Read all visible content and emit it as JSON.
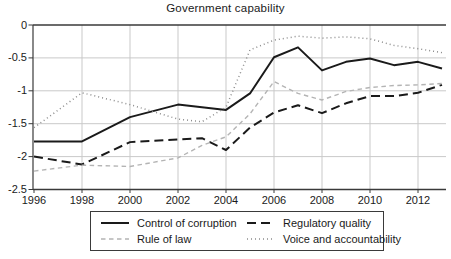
{
  "title": "Government capability",
  "colors": {
    "axis": "#3a3a3a",
    "grid": "#c9c9c9",
    "text": "#1a1a1a",
    "series_black": "#1a1a1a",
    "series_gray_light": "#b4b4b4",
    "series_gray_mid": "#8c8c8c"
  },
  "chart_data": {
    "type": "line",
    "title": "Government capability",
    "xlabel": "",
    "ylabel": "",
    "xlim": [
      1996,
      2013.2
    ],
    "ylim": [
      -2.5,
      0
    ],
    "grid": true,
    "legend_position": "bottom",
    "x": [
      1996,
      1998,
      2000,
      2002,
      2003,
      2004,
      2005,
      2006,
      2007,
      2008,
      2009,
      2010,
      2011,
      2012,
      2013
    ],
    "x_tick_values": [
      1996,
      1998,
      2000,
      2002,
      2004,
      2006,
      2008,
      2010,
      2012
    ],
    "x_tick_labels": [
      "1996",
      "1998",
      "2000",
      "2002",
      "2004",
      "2006",
      "2008",
      "2010",
      "2012"
    ],
    "y_tick_values": [
      0,
      -0.5,
      -1,
      -1.5,
      -2,
      -2.5
    ],
    "y_tick_labels": [
      "0",
      "-0.5",
      "-1",
      "-1.5",
      "-2",
      "-2.5"
    ],
    "series": [
      {
        "name": "Control of corruption",
        "style": "solid",
        "color": "#1a1a1a",
        "width": 2,
        "values": [
          -1.77,
          -1.77,
          -1.4,
          -1.21,
          -1.25,
          -1.29,
          -1.04,
          -0.49,
          -0.34,
          -0.69,
          -0.56,
          -0.51,
          -0.61,
          -0.56,
          -0.66
        ]
      },
      {
        "name": "Regulatory quality",
        "style": "dashed",
        "color": "#1a1a1a",
        "width": 2,
        "values": [
          -2.0,
          -2.12,
          -1.78,
          -1.74,
          -1.72,
          -1.9,
          -1.56,
          -1.33,
          -1.22,
          -1.34,
          -1.19,
          -1.08,
          -1.08,
          -1.03,
          -0.91
        ]
      },
      {
        "name": "Rule of law",
        "style": "dashed-light",
        "color": "#b4b4b4",
        "width": 1.4,
        "values": [
          -2.22,
          -2.13,
          -2.15,
          -2.02,
          -1.83,
          -1.7,
          -1.35,
          -0.86,
          -1.04,
          -1.14,
          -1.01,
          -0.95,
          -0.92,
          -0.91,
          -0.89
        ]
      },
      {
        "name": "Voice and accountability",
        "style": "dotted",
        "color": "#8c8c8c",
        "width": 1.5,
        "values": [
          -1.56,
          -1.03,
          -1.21,
          -1.43,
          -1.47,
          -1.25,
          -0.38,
          -0.23,
          -0.17,
          -0.2,
          -0.18,
          -0.21,
          -0.31,
          -0.36,
          -0.42
        ]
      }
    ]
  }
}
